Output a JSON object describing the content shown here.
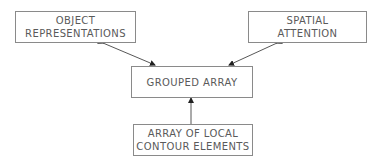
{
  "diagram": {
    "nodes": [
      {
        "id": "object_representations",
        "lines": [
          "OBJECT",
          "REPRESENTATIONS"
        ]
      },
      {
        "id": "spatial_attention",
        "lines": [
          "SPATIAL",
          "ATTENTION"
        ]
      },
      {
        "id": "grouped_array",
        "lines": [
          "GROUPED ARRAY"
        ]
      },
      {
        "id": "array_of_local_contour_elements",
        "lines": [
          "ARRAY OF LOCAL",
          "CONTOUR ELEMENTS"
        ]
      }
    ],
    "edges": [
      {
        "from": "grouped_array",
        "to": "object_representations",
        "type": "bidirectional"
      },
      {
        "from": "grouped_array",
        "to": "spatial_attention",
        "type": "bidirectional"
      },
      {
        "from": "array_of_local_contour_elements",
        "to": "grouped_array",
        "type": "unidirectional"
      }
    ],
    "colors": {
      "border": "#8a8a8a",
      "text": "#5a5a5a",
      "arrow": "#333333"
    }
  }
}
